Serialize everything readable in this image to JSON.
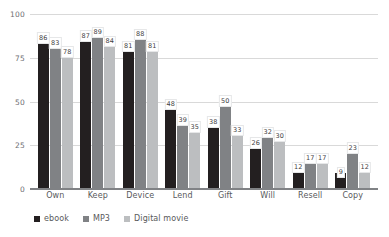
{
  "chart_data": {
    "type": "bar",
    "title": "",
    "subtitle": "",
    "xlabel": "",
    "ylabel": "",
    "ylim": [
      0,
      100
    ],
    "yticks": [
      0,
      25,
      50,
      75,
      100
    ],
    "ytick_labels": [
      "0",
      "25",
      "50",
      "75",
      "100"
    ],
    "grid": true,
    "legend_position": "bottom-left",
    "show_data_labels": true,
    "categories": [
      "Own",
      "Keep",
      "Device",
      "Lend",
      "Gift",
      "Will",
      "Resell",
      "Copy"
    ],
    "series": [
      {
        "name": "ebook",
        "color": "#231f20",
        "values": [
          86,
          87,
          81,
          48,
          38,
          26,
          12,
          9
        ]
      },
      {
        "name": "MP3",
        "color": "#808285",
        "values": [
          83,
          89,
          88,
          39,
          50,
          32,
          17,
          23
        ]
      },
      {
        "name": "Digital movie",
        "color": "#bcbec0",
        "values": [
          78,
          84,
          81,
          35,
          33,
          30,
          17,
          12
        ]
      }
    ]
  },
  "axis": {
    "tick_0": "0",
    "tick_25": "25",
    "tick_50": "50",
    "tick_75": "75",
    "tick_100": "100"
  },
  "legend": {
    "items": [
      {
        "label": "ebook",
        "color": "#231f20"
      },
      {
        "label": "MP3",
        "color": "#808285"
      },
      {
        "label": "Digital movie",
        "color": "#bcbec0"
      }
    ]
  },
  "colors": {
    "gridline": "#d9d9d9",
    "axis": "#808285",
    "label_text": "#58595b",
    "tick_text": "#6d6e71",
    "background": "#ffffff"
  }
}
